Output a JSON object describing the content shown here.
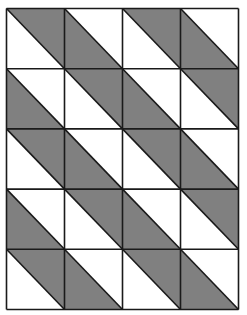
{
  "diagram": {
    "type": "tiling-pattern",
    "grid": {
      "rows": 5,
      "cols": 4,
      "left": 6.5,
      "top": 8.5,
      "right": 238.5,
      "bottom": 309.5
    },
    "colors": {
      "background": "#ffffff",
      "shade": "#808080",
      "line": "#1a1a1a"
    },
    "line_width": 1.6,
    "shading": [
      [
        "upper-right",
        "lower-left",
        "upper-right",
        "lower-left"
      ],
      [
        "lower-left",
        "upper-right",
        "lower-left",
        "upper-right"
      ],
      [
        "upper-right",
        "lower-left",
        "upper-right",
        "lower-left"
      ],
      [
        "lower-left",
        "upper-right",
        "lower-left",
        "upper-right"
      ],
      [
        "upper-right",
        "lower-left",
        "upper-right",
        "lower-left"
      ]
    ]
  }
}
